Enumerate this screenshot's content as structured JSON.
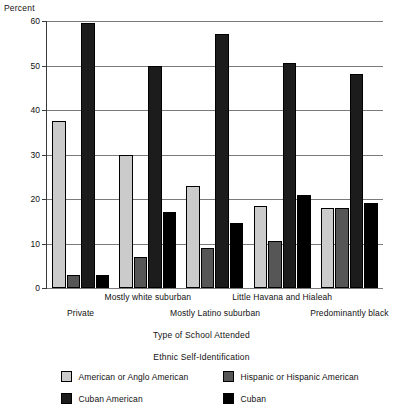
{
  "chart_data": {
    "type": "bar",
    "title": "",
    "xlabel": "Type of School Attended",
    "ylabel": "Percent",
    "ylim": [
      0,
      60
    ],
    "yticks": [
      0,
      10,
      20,
      30,
      40,
      50,
      60
    ],
    "ytick_labels": [
      "0",
      "10",
      "20",
      "30",
      "40",
      "50",
      "60"
    ],
    "grid": "horizontal",
    "legend_title": "Ethnic Self-Identification",
    "legend_position": "bottom",
    "categories": [
      "Private",
      "Mostly white suburban",
      "Mostly Latino suburban",
      "Little Havana and Hialeah",
      "Predominantly black"
    ],
    "series": [
      {
        "name": "American or Anglo American",
        "color": "#cbcbcb",
        "values": [
          37.5,
          30,
          23,
          18.5,
          18
        ]
      },
      {
        "name": "Hispanic or Hispanic American",
        "color": "#565656",
        "values": [
          3,
          7,
          9,
          10.5,
          18
        ]
      },
      {
        "name": "Cuban American",
        "color": "#1c1c1c",
        "values": [
          59.5,
          50,
          57,
          50.5,
          48
        ]
      },
      {
        "name": "Cuban",
        "color": "#000000",
        "values": [
          3,
          17,
          14.5,
          21,
          19
        ]
      }
    ]
  },
  "axis": {
    "y_title": "Percent",
    "x_title": "Type of School Attended"
  },
  "legend": {
    "title": "Ethnic Self-Identification",
    "items": [
      {
        "label": "American or Anglo American",
        "swatch": "s0"
      },
      {
        "label": "Hispanic or Hispanic American",
        "swatch": "s1"
      },
      {
        "label": "Cuban American",
        "swatch": "s2"
      },
      {
        "label": "Cuban",
        "swatch": "s3"
      }
    ]
  }
}
